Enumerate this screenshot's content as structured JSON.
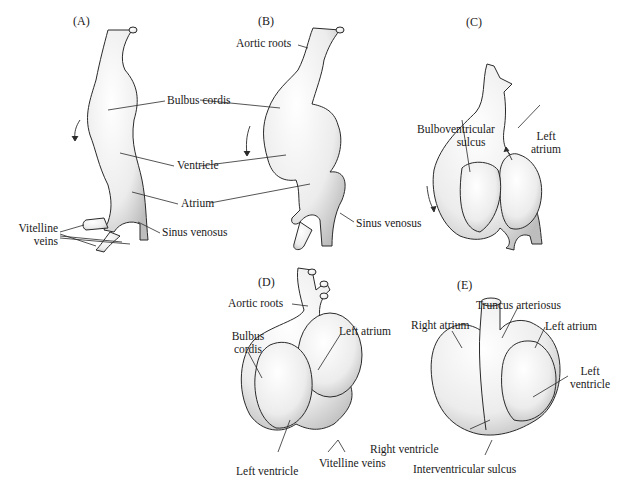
{
  "figure": {
    "panels": [
      {
        "id": "A",
        "label": "(A)",
        "annotations": [
          "Bulbus cordis",
          "Ventricle",
          "Atrium",
          "Sinus venosus"
        ],
        "vitelline": [
          "Vitelline",
          "veins"
        ]
      },
      {
        "id": "B",
        "label": "(B)",
        "annotations": [
          "Aortic roots",
          "Sinus venosus"
        ]
      },
      {
        "id": "C",
        "label": "(C)",
        "bulboventricular": [
          "Bulboventricular",
          "sulcus"
        ],
        "left_atrium": [
          "Left",
          "atrium"
        ]
      },
      {
        "id": "D",
        "label": "(D)",
        "annotations": [
          "Aortic roots",
          "Left atrium",
          "Left ventricle",
          "Vitelline veins"
        ],
        "bulbus": [
          "Bulbus",
          "cordis"
        ]
      },
      {
        "id": "E",
        "label": "(E)",
        "annotations": [
          "Truncus arteriosus",
          "Right atrium",
          "Left atrium",
          "Right ventricle",
          "Interventricular sulcus"
        ],
        "left_ventricle": [
          "Left",
          "ventricle"
        ]
      }
    ]
  },
  "colors": {
    "stroke": "#2a2a2a",
    "fill": "#f2f2f2",
    "shade": "#cfcfcf"
  }
}
